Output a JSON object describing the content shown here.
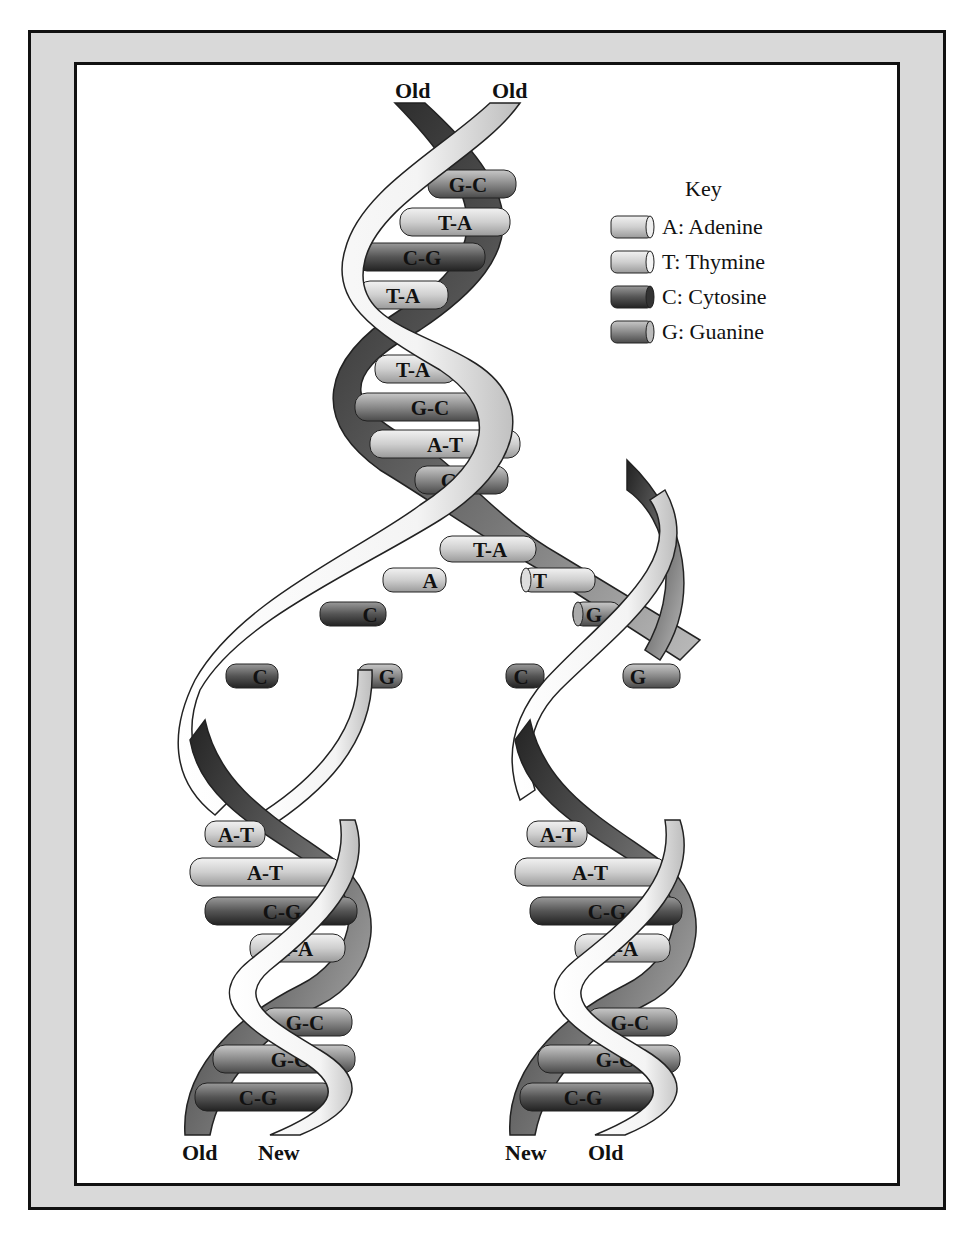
{
  "diagram": {
    "strand_labels": {
      "top_left": "Old",
      "top_right": "Old",
      "bottom_left_1": "Old",
      "bottom_left_2": "New",
      "bottom_right_1": "New",
      "bottom_right_2": "Old"
    },
    "key": {
      "title": "Key",
      "items": [
        {
          "code": "A",
          "label": "A: Adenine",
          "color": "#cfcfcf"
        },
        {
          "code": "T",
          "label": "T: Thymine",
          "color": "#dadada"
        },
        {
          "code": "C",
          "label": "C: Cytosine",
          "color": "#555555"
        },
        {
          "code": "G",
          "label": "G: Guanine",
          "color": "#8a8a8a"
        }
      ]
    },
    "parent_helix_pairs": [
      "G-C",
      "T-A",
      "C-G",
      "T-A",
      "T-A",
      "G-C",
      "A-T",
      "G-C",
      "T-A"
    ],
    "unpaired_bases_left": [
      "A",
      "C",
      "C",
      "G"
    ],
    "unpaired_bases_right": [
      "T",
      "G",
      "C",
      "G"
    ],
    "daughter_left_pairs": [
      "A-T",
      "A-T",
      "C-G",
      "T-A",
      "G-C",
      "G-C",
      "C-G"
    ],
    "daughter_right_pairs": [
      "A-T",
      "A-T",
      "C-G",
      "T-A",
      "G-C",
      "G-C",
      "C-G"
    ]
  }
}
